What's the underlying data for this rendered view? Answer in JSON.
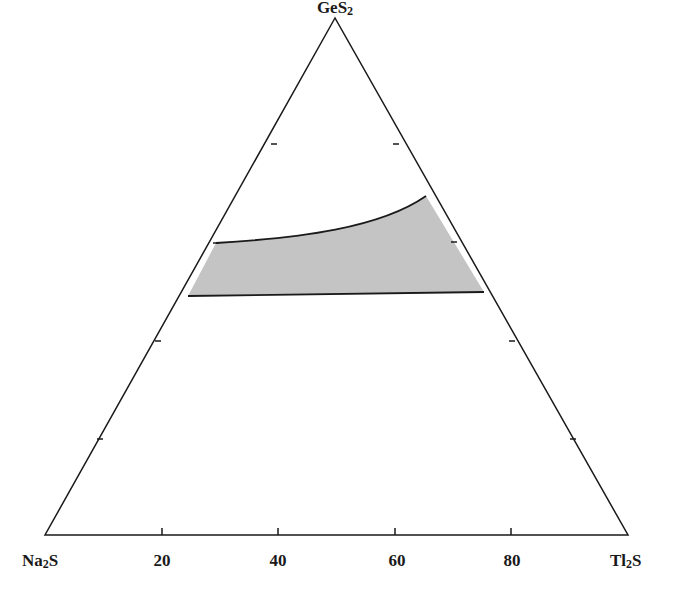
{
  "diagram": {
    "type": "ternary-phase-diagram",
    "vertices": {
      "top": {
        "label": "GeS",
        "subscript": "2"
      },
      "left": {
        "label": "Na",
        "subscript": "2",
        "suffix": "S"
      },
      "right": {
        "label": "Tl",
        "subscript": "2",
        "suffix": "S"
      }
    },
    "bottom_axis_ticks": [
      "20",
      "40",
      "60",
      "80"
    ],
    "shaded_region": {
      "description": "glass-forming region",
      "fill_color": "#c4c4c4"
    },
    "colors": {
      "line": "#1a1a1a",
      "background": "#ffffff"
    }
  }
}
